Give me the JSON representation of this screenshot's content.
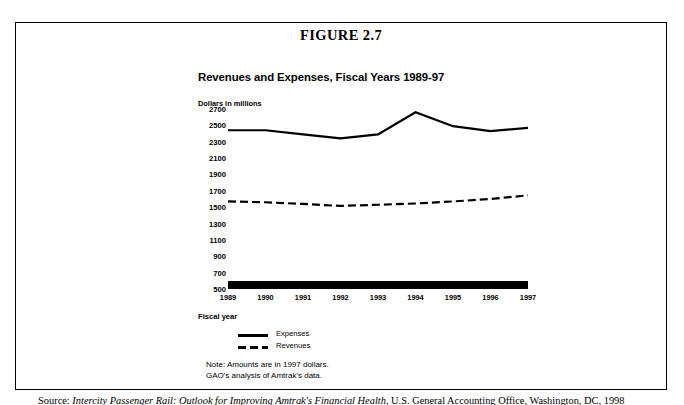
{
  "figure": {
    "number_label": "FIGURE 2.7",
    "chart_title": "Revenues and Expenses, Fiscal Years 1989-97"
  },
  "notes": {
    "line1": "Note: Amounts are in 1997 dollars.",
    "line2": "GAO's analysis of Amtrak's data."
  },
  "source": {
    "prefix": "Source:",
    "title_italic": "Intercity Passenger Rail: Outlook for Improving Amtrak's Financial Health",
    "rest": ", U.S. General Accounting Office, Washington, DC, 1998"
  },
  "chart_data": {
    "type": "line",
    "title": "Revenues and Expenses, Fiscal Years 1989-97",
    "xlabel": "Fiscal year",
    "ylabel": "Dollars in millions",
    "grid": false,
    "legend_position": "below",
    "categories": [
      "1989",
      "1990",
      "1991",
      "1992",
      "1993",
      "1994",
      "1995",
      "1996",
      "1997"
    ],
    "ylim": [
      500,
      2700
    ],
    "ytick_step": 200,
    "yticks": [
      2700,
      2500,
      2300,
      2100,
      1900,
      1700,
      1500,
      1300,
      1100,
      900,
      700,
      500
    ],
    "series": [
      {
        "name": "Expenses",
        "style": "solid",
        "color": "#000000",
        "values": [
          2440,
          2440,
          2390,
          2340,
          2390,
          2660,
          2490,
          2430,
          2470
        ]
      },
      {
        "name": "Revenues",
        "style": "dashed",
        "color": "#000000",
        "values": [
          1570,
          1560,
          1540,
          1515,
          1530,
          1545,
          1570,
          1600,
          1645
        ]
      }
    ]
  }
}
